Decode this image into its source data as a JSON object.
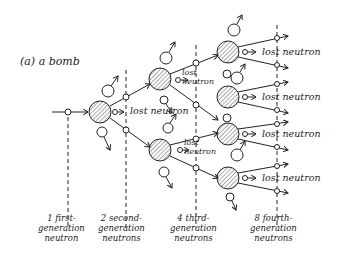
{
  "title": "(a) a bomb",
  "lost_labels": {
    "center": "lost neutron",
    "upper_small": "lost neutron",
    "lower_small": "lost neutron",
    "right_1": "lost neutron",
    "right_2": "lost neutron",
    "right_3": "lost neutron",
    "right_4": "lost neutron"
  },
  "generations": [
    {
      "count": "1",
      "line1": "first-",
      "line2": "generation",
      "line3": "neutron"
    },
    {
      "count": "2",
      "line1": "second-",
      "line2": "generation",
      "line3": "neutrons"
    },
    {
      "count": "4",
      "line1": "third-",
      "line2": "generation",
      "line3": "neutrons"
    },
    {
      "count": "8",
      "line1": "fourth-",
      "line2": "generation",
      "line3": "neutrons"
    }
  ],
  "colors": {
    "ink": "#222222",
    "background": "#ffffff"
  }
}
